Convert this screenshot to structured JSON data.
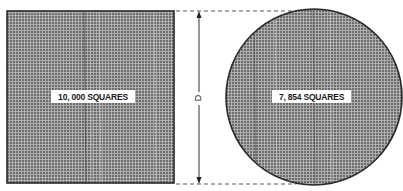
{
  "figure": {
    "header_text": "",
    "square": {
      "label": "10, 000 SQUARES",
      "count": 10000
    },
    "circle": {
      "label": "7, 854 SQUARES",
      "count": 7854
    },
    "dimension": {
      "label": "D"
    },
    "colors": {
      "fill_dark": "#6e6e6e",
      "grid_line": "#b8b8b8",
      "outline": "#2a2a2a",
      "label_bg": "#ffffff",
      "dash": "#555555"
    }
  }
}
